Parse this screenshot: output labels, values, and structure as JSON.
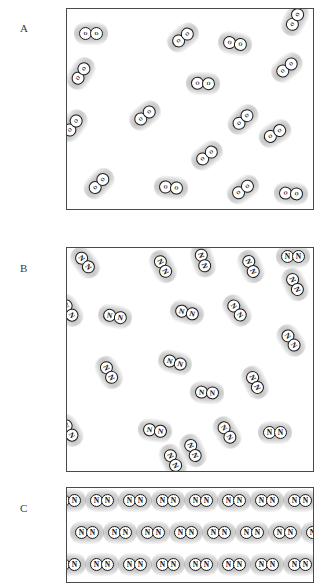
{
  "figure": {
    "caption_letters": [
      "A",
      "B",
      "C"
    ],
    "background_color": "#ffffff",
    "atom_outline_color": "#1b1b1b",
    "halo_color": "#9a9a9a"
  },
  "panels": [
    {
      "label": "A",
      "species": "O",
      "state": "gas",
      "molecule_count": 16,
      "box": {
        "x": 66,
        "y": 8,
        "width": 246,
        "height": 200
      },
      "label_pos": {
        "x": 20,
        "y": 22
      },
      "molecules": [
        {
          "x": 12,
          "y": 18,
          "angle": 0
        },
        {
          "x": 104,
          "y": 22,
          "angle": -38
        },
        {
          "x": 156,
          "y": 28,
          "angle": 10
        },
        {
          "x": 216,
          "y": 4,
          "angle": -62
        },
        {
          "x": 2,
          "y": 58,
          "angle": -58
        },
        {
          "x": 124,
          "y": 68,
          "angle": 2
        },
        {
          "x": 208,
          "y": 52,
          "angle": -40
        },
        {
          "x": 66,
          "y": 100,
          "angle": -40
        },
        {
          "x": -6,
          "y": 110,
          "angle": -55
        },
        {
          "x": 164,
          "y": 104,
          "angle": -44
        },
        {
          "x": 196,
          "y": 118,
          "angle": -32
        },
        {
          "x": 128,
          "y": 140,
          "angle": -38
        },
        {
          "x": 20,
          "y": 168,
          "angle": -46
        },
        {
          "x": 92,
          "y": 172,
          "angle": 6
        },
        {
          "x": 164,
          "y": 174,
          "angle": -36
        },
        {
          "x": 212,
          "y": 178,
          "angle": 4
        }
      ]
    },
    {
      "label": "B",
      "species": "N",
      "state": "gas",
      "molecule_count": 21,
      "box": {
        "x": 66,
        "y": 247,
        "width": 246,
        "height": 223
      },
      "label_pos": {
        "x": 20,
        "y": 262
      },
      "molecules": [
        {
          "x": 6,
          "y": 8,
          "angle": 52
        },
        {
          "x": 84,
          "y": 12,
          "angle": 62
        },
        {
          "x": 124,
          "y": 6,
          "angle": 72
        },
        {
          "x": 172,
          "y": 12,
          "angle": 66
        },
        {
          "x": 214,
          "y": 2,
          "angle": 0
        },
        {
          "x": 216,
          "y": 30,
          "angle": 64
        },
        {
          "x": -10,
          "y": 56,
          "angle": 58
        },
        {
          "x": 36,
          "y": 62,
          "angle": 12
        },
        {
          "x": 108,
          "y": 58,
          "angle": 14
        },
        {
          "x": 158,
          "y": 56,
          "angle": 54
        },
        {
          "x": 212,
          "y": 86,
          "angle": 56
        },
        {
          "x": 30,
          "y": 118,
          "angle": 62
        },
        {
          "x": 96,
          "y": 108,
          "angle": 16
        },
        {
          "x": 128,
          "y": 138,
          "angle": 4
        },
        {
          "x": 176,
          "y": 128,
          "angle": 64
        },
        {
          "x": -10,
          "y": 176,
          "angle": 58
        },
        {
          "x": 76,
          "y": 176,
          "angle": 8
        },
        {
          "x": 114,
          "y": 196,
          "angle": 66
        },
        {
          "x": 148,
          "y": 178,
          "angle": 58
        },
        {
          "x": 196,
          "y": 178,
          "angle": 0
        },
        {
          "x": 94,
          "y": 206,
          "angle": 62
        }
      ]
    },
    {
      "label": "C",
      "species": "N",
      "state": "solid",
      "molecule_count": 27,
      "box": {
        "x": 66,
        "y": 487,
        "width": 246,
        "height": 94
      },
      "label_pos": {
        "x": 20,
        "y": 502
      },
      "lattice": {
        "rows": 3,
        "row_y": [
          6,
          38,
          70
        ],
        "row_offset": [
          -10,
          8,
          -10
        ],
        "spacing": 33,
        "per_row": 9,
        "angle": 0
      }
    }
  ]
}
